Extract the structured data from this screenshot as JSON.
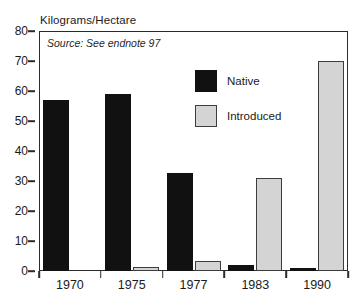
{
  "chart_data": {
    "type": "bar",
    "title": "Kilograms/Hectare",
    "xlabel": "",
    "ylabel": "Kilograms/Hectare",
    "categories": [
      "1970",
      "1975",
      "1977",
      "1983",
      "1990"
    ],
    "series": [
      {
        "name": "Native",
        "color": "#111111",
        "values": [
          57,
          59,
          32.7,
          2,
          1
        ]
      },
      {
        "name": "Introduced",
        "color": "#d4d4d4",
        "values": [
          0,
          1.5,
          3.5,
          31,
          70
        ]
      }
    ],
    "ylim": [
      0,
      80
    ],
    "yticks": [
      0,
      10,
      20,
      30,
      40,
      50,
      60,
      70,
      80
    ],
    "ytick_labels": [
      "0",
      "10",
      "20",
      "30",
      "40",
      "50",
      "60",
      "70",
      "80"
    ],
    "grid": false,
    "legend_position": "upper-center",
    "annotations": [
      {
        "name": "source-note",
        "text": "Source: See endnote 97",
        "style": "italic"
      }
    ]
  },
  "legend": {
    "items": [
      {
        "label": "Native"
      },
      {
        "label": "Introduced"
      }
    ]
  },
  "notes": {
    "source": "Source: See endnote 97"
  }
}
